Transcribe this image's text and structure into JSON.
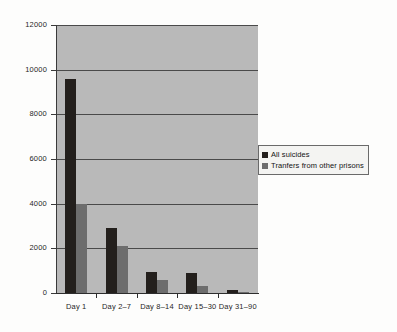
{
  "chart_data": {
    "type": "bar",
    "title": "",
    "subtitle": "",
    "xlabel": "",
    "ylabel": "",
    "categories": [
      "Day 1",
      "Day 2–7",
      "Day 8–14",
      "Day 15–30",
      "Day 31–90"
    ],
    "series": [
      {
        "name": "All suicides",
        "values": [
          9600,
          2900,
          950,
          900,
          150
        ],
        "color": "#231f1c"
      },
      {
        "name": "Tranfers from other prisons",
        "values": [
          4000,
          2100,
          600,
          300,
          50
        ],
        "color": "#6d6d6d"
      }
    ],
    "ylim": [
      0,
      12000
    ],
    "yticks": [
      0,
      2000,
      4000,
      6000,
      8000,
      10000,
      12000
    ],
    "ytick_labels": [
      "0",
      "2000",
      "4000",
      "6000",
      "8000",
      "10000",
      "12000"
    ],
    "grid": true,
    "grid_axis": "y",
    "legend_position": "center right",
    "plot_background": "#b9b9b9",
    "figure_background": "#fdfdfc"
  },
  "legend": {
    "entries": [
      {
        "label": "All suicides"
      },
      {
        "label": "Tranfers from other prisons"
      }
    ]
  }
}
